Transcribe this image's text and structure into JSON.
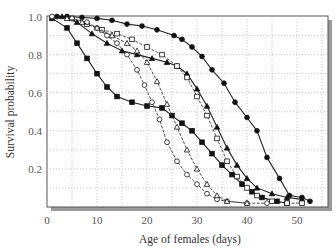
{
  "chart_data": {
    "type": "line",
    "title": "",
    "xlabel": "Age of females (days)",
    "ylabel": "Survival probability",
    "xlim": [
      0,
      55
    ],
    "ylim": [
      0,
      1.0
    ],
    "xticks": [
      0,
      10,
      20,
      30,
      40,
      50
    ],
    "yticks": [
      0.2,
      0.4,
      0.6,
      0.8,
      1.0
    ],
    "ytick_labels": [
      "0.2",
      "0.4",
      "0.6",
      "0.8",
      "1.0"
    ],
    "grid": true,
    "legend": null,
    "series": [
      {
        "name": "filled-circles",
        "marker": "circle",
        "filled": true,
        "dashed": false,
        "points": [
          [
            2,
            1.0
          ],
          [
            4,
            1.0
          ],
          [
            7,
            0.995
          ],
          [
            10,
            0.99
          ],
          [
            13,
            0.98
          ],
          [
            16,
            0.96
          ],
          [
            19,
            0.95
          ],
          [
            22,
            0.93
          ],
          [
            25.4,
            0.9
          ],
          [
            27,
            0.88
          ],
          [
            29,
            0.84
          ],
          [
            31,
            0.79
          ],
          [
            33,
            0.72
          ],
          [
            35.4,
            0.65
          ],
          [
            37.6,
            0.55
          ],
          [
            40,
            0.47
          ],
          [
            42,
            0.4
          ],
          [
            44,
            0.26
          ],
          [
            46.5,
            0.15
          ],
          [
            48.5,
            0.06
          ],
          [
            51,
            0.05
          ],
          [
            52.6,
            0.03
          ]
        ]
      },
      {
        "name": "filled-squares",
        "marker": "square",
        "filled": true,
        "dashed": false,
        "points": [
          [
            1,
            0.99
          ],
          [
            4,
            0.94
          ],
          [
            6,
            0.86
          ],
          [
            8,
            0.78
          ],
          [
            10,
            0.7
          ],
          [
            12,
            0.63
          ],
          [
            14,
            0.58
          ],
          [
            17,
            0.55
          ],
          [
            20,
            0.53
          ],
          [
            23,
            0.52
          ],
          [
            25,
            0.48
          ],
          [
            27,
            0.44
          ],
          [
            29,
            0.4
          ],
          [
            31,
            0.34
          ],
          [
            33,
            0.28
          ],
          [
            35,
            0.22
          ],
          [
            37,
            0.17
          ],
          [
            39,
            0.12
          ],
          [
            41,
            0.08
          ],
          [
            43,
            0.05
          ],
          [
            46,
            0.03
          ],
          [
            48,
            0.02
          ]
        ]
      },
      {
        "name": "filled-triangles",
        "marker": "triangle",
        "filled": true,
        "dashed": false,
        "points": [
          [
            3,
            1.0
          ],
          [
            6,
            0.97
          ],
          [
            9,
            0.91
          ],
          [
            12,
            0.86
          ],
          [
            15,
            0.82
          ],
          [
            18,
            0.8
          ],
          [
            21,
            0.78
          ],
          [
            24,
            0.76
          ],
          [
            26,
            0.74
          ],
          [
            28,
            0.7
          ],
          [
            30,
            0.62
          ],
          [
            32,
            0.53
          ],
          [
            34,
            0.42
          ],
          [
            36,
            0.31
          ],
          [
            38,
            0.22
          ],
          [
            40,
            0.15
          ],
          [
            42,
            0.1
          ],
          [
            45,
            0.07
          ],
          [
            48,
            0.05
          ],
          [
            51,
            0.04
          ]
        ]
      },
      {
        "name": "open-squares",
        "marker": "square",
        "filled": false,
        "dashed": true,
        "points": [
          [
            5,
            0.99
          ],
          [
            8,
            0.96
          ],
          [
            11,
            0.93
          ],
          [
            14,
            0.91
          ],
          [
            17,
            0.88
          ],
          [
            20,
            0.84
          ],
          [
            23,
            0.8
          ],
          [
            26,
            0.74
          ],
          [
            28,
            0.68
          ],
          [
            30,
            0.58
          ],
          [
            32,
            0.48
          ],
          [
            34,
            0.36
          ],
          [
            36,
            0.24
          ],
          [
            38,
            0.16
          ],
          [
            40,
            0.1
          ],
          [
            42,
            0.06
          ],
          [
            45,
            0.03
          ],
          [
            48,
            0.02
          ],
          [
            51,
            0.02
          ]
        ]
      },
      {
        "name": "open-circles",
        "marker": "circle",
        "filled": false,
        "dashed": true,
        "points": [
          [
            1,
            1.0
          ],
          [
            5,
            0.99
          ],
          [
            8,
            0.97
          ],
          [
            10,
            0.94
          ],
          [
            12,
            0.9
          ],
          [
            14,
            0.86
          ],
          [
            16,
            0.8
          ],
          [
            18,
            0.72
          ],
          [
            19.5,
            0.64
          ],
          [
            21,
            0.55
          ],
          [
            22.5,
            0.46
          ],
          [
            24,
            0.34
          ],
          [
            26,
            0.24
          ],
          [
            28,
            0.17
          ],
          [
            30,
            0.12
          ],
          [
            32,
            0.07
          ],
          [
            34,
            0.04
          ],
          [
            36,
            0.03
          ],
          [
            40,
            0.02
          ],
          [
            44,
            0.02
          ]
        ]
      },
      {
        "name": "open-triangles",
        "marker": "triangle",
        "filled": false,
        "dashed": true,
        "points": [
          [
            4,
            0.99
          ],
          [
            7,
            0.97
          ],
          [
            10,
            0.94
          ],
          [
            13,
            0.9
          ],
          [
            16,
            0.86
          ],
          [
            18,
            0.82
          ],
          [
            20,
            0.76
          ],
          [
            22,
            0.66
          ],
          [
            24,
            0.54
          ],
          [
            26,
            0.42
          ],
          [
            28,
            0.3
          ],
          [
            30,
            0.2
          ],
          [
            32,
            0.12
          ],
          [
            34,
            0.06
          ],
          [
            36,
            0.03
          ],
          [
            40,
            0.02
          ]
        ]
      }
    ]
  }
}
